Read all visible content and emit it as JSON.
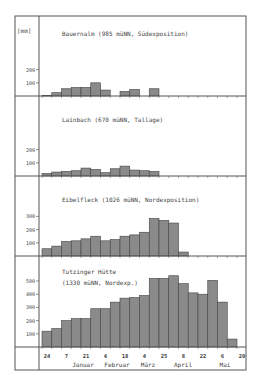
{
  "chart_data": {
    "type": "bar",
    "title": "",
    "ylabel": "[mm]",
    "xlabel": "",
    "x_tick_labels": [
      "24",
      "7",
      "21",
      "4",
      "18",
      "4",
      "25",
      "8",
      "22",
      "6",
      "20"
    ],
    "month_labels": [
      "Januar",
      "Februar",
      "März",
      "April",
      "Mai"
    ],
    "grid": false,
    "legend": null,
    "panels": [
      {
        "name": "Bauernalm (985 müNN, Südexposition)",
        "yticks": [
          100,
          200
        ],
        "values": [
          5,
          25,
          55,
          65,
          65,
          100,
          45,
          0,
          35,
          50,
          0,
          55
        ]
      },
      {
        "name": "Lainbach (670 müNN, Tallage)",
        "yticks": [
          100,
          200
        ],
        "values": [
          20,
          30,
          35,
          40,
          60,
          50,
          25,
          55,
          75,
          45,
          40,
          35
        ]
      },
      {
        "name": "Eibelfleck (1026 müNN, Nordexposition)",
        "yticks": [
          100,
          200,
          300
        ],
        "values": [
          55,
          75,
          110,
          115,
          130,
          150,
          115,
          125,
          150,
          160,
          180,
          285,
          270,
          250,
          30
        ]
      },
      {
        "name": "Tutzinger Hütte (1330 müNN, Nordexp.)",
        "name_lines": [
          "Tutzinger Hütte",
          "(1330 müNN, Nordexp.)"
        ],
        "yticks": [
          100,
          200,
          300,
          400,
          500
        ],
        "values": [
          120,
          140,
          200,
          215,
          215,
          290,
          290,
          340,
          370,
          375,
          390,
          520,
          520,
          540,
          480,
          410,
          400,
          505,
          340,
          60
        ]
      }
    ]
  },
  "labels": {
    "unit": "[mm]",
    "panel1_title": "Bauernalm  (985 müNN, Südexposition)",
    "panel2_title": "Lainbach    (670 müNN, Tallage)",
    "panel3_title": "Eibelfleck   (1026 müNN, Nordexposition)",
    "panel4_title_line1": "Tutzinger Hütte",
    "panel4_title_line2": "(1330 müNN, Nordexp.)"
  },
  "colors": {
    "bar_fill": "#8a8a8a",
    "bar_stroke": "#444444",
    "frame": "#555555"
  }
}
